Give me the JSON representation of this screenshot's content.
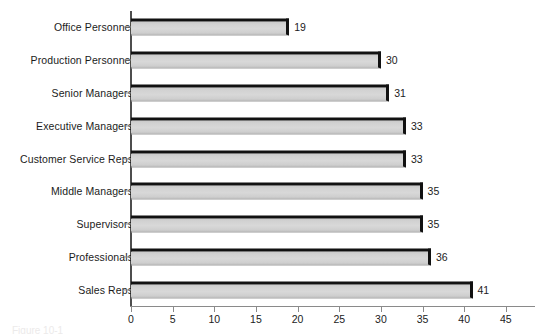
{
  "chart_data": {
    "type": "bar",
    "orientation": "horizontal",
    "title": "",
    "xlabel": "",
    "ylabel": "",
    "categories": [
      "Office Personnel",
      "Production Personnel",
      "Senior Managers",
      "Executive Managers",
      "Customer Service Reps",
      "Middle Managers",
      "Supervisors",
      "Professionals",
      "Sales Reps"
    ],
    "values": [
      19,
      30,
      31,
      33,
      33,
      35,
      35,
      36,
      41
    ],
    "value_labels": [
      "19",
      "30",
      "31",
      "33",
      "33",
      "35",
      "35",
      "36",
      "41"
    ],
    "xlim": [
      0,
      48.5
    ],
    "xticks": [
      0,
      5,
      10,
      15,
      20,
      25,
      30,
      35,
      40,
      45
    ],
    "xtick_labels": [
      "0",
      "5",
      "10",
      "15",
      "20",
      "25",
      "30",
      "35",
      "40",
      "45"
    ],
    "grid": false,
    "legend": null,
    "bar_fill_color": "#d4d4d4",
    "bar_edge_color": "#111111",
    "axis_color": "#8a8a8a",
    "text_color": "#1b1b1b",
    "background_color": "#ffffff"
  },
  "caption": {
    "sliver_text": "Figure 10-1"
  }
}
